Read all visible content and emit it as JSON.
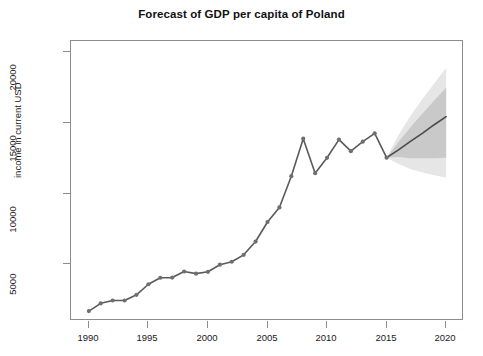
{
  "chart_data": {
    "type": "line",
    "title": "Forecast of GDP per capita of Poland",
    "xlabel": "",
    "ylabel": "income in current USD",
    "xlim": [
      1988.5,
      2021.5
    ],
    "ylim": [
      1000,
      20800
    ],
    "grid": false,
    "legend": null,
    "x_ticks": [
      1990,
      1995,
      2000,
      2005,
      2010,
      2015,
      2020
    ],
    "y_ticks": [
      5000,
      10000,
      15000,
      20000
    ],
    "series": [
      {
        "name": "historical GDP per capita",
        "type": "line",
        "color": "#5a5a5a",
        "marker": "circle",
        "x": [
          1990,
          1991,
          1992,
          1993,
          1994,
          1995,
          1996,
          1997,
          1998,
          1999,
          2000,
          2001,
          2002,
          2003,
          2004,
          2005,
          2006,
          2007,
          2008,
          2009,
          2010,
          2011,
          2012,
          2013,
          2014,
          2015
        ],
        "values": [
          1700,
          2250,
          2450,
          2450,
          2850,
          3600,
          4060,
          4070,
          4500,
          4350,
          4480,
          4980,
          5190,
          5680,
          6620,
          8000,
          9030,
          11240,
          13890,
          11450,
          12540,
          13830,
          13010,
          13680,
          14270,
          12550
        ]
      },
      {
        "name": "point forecast",
        "type": "line",
        "color": "#4a4a4a",
        "x": [
          2015,
          2016,
          2017,
          2018,
          2019,
          2020
        ],
        "values": [
          12550,
          13100,
          13700,
          14270,
          14880,
          15450
        ]
      }
    ],
    "forecast_bands": [
      {
        "name": "95% prediction interval",
        "color": "#e6e6e6",
        "x": [
          2015,
          2016,
          2017,
          2018,
          2019,
          2020
        ],
        "lower": [
          12550,
          12100,
          11750,
          11500,
          11300,
          11150
        ],
        "upper": [
          12550,
          14150,
          15500,
          16700,
          17800,
          18900
        ]
      },
      {
        "name": "80% prediction interval",
        "color": "#c9c9c9",
        "x": [
          2015,
          2016,
          2017,
          2018,
          2019,
          2020
        ],
        "lower": [
          12550,
          12600,
          12500,
          12500,
          12500,
          12550
        ],
        "upper": [
          12550,
          13650,
          14700,
          15650,
          16600,
          17500
        ]
      }
    ]
  },
  "axis": {
    "y_title": "income in current USD",
    "y_tick_labels": [
      "5000",
      "10000",
      "15000",
      "20000"
    ],
    "x_tick_labels": [
      "1990",
      "1995",
      "2000",
      "2005",
      "2010",
      "2015",
      "2020"
    ]
  },
  "colors": {
    "line": "#5a5a5a",
    "marker": "#6f6f6f",
    "band_outer": "#e6e6e6",
    "band_inner": "#c9c9c9",
    "frame": "#8d8d8d",
    "text": "#1a1a1a"
  }
}
